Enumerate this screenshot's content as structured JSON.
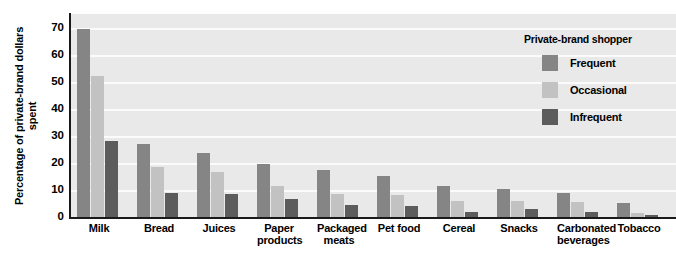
{
  "chart_data": {
    "type": "bar",
    "title": "",
    "xlabel": "",
    "ylabel": "Percentage of private-brand dollars spent",
    "ylim": [
      0,
      75
    ],
    "yticks": [
      0,
      10,
      20,
      30,
      40,
      50,
      60,
      70
    ],
    "grid": true,
    "legend_position": "top-right",
    "legend_title": "Private-brand shopper",
    "categories": [
      "Milk",
      "Bread",
      "Juices",
      "Paper products",
      "Packaged meats",
      "Pet food",
      "Cereal",
      "Snacks",
      "Carbonated beverages",
      "Tobacco"
    ],
    "series": [
      {
        "name": "Frequent",
        "color": "#858585",
        "values": [
          69.5,
          27,
          23.5,
          19.5,
          17.5,
          15,
          11.5,
          10.5,
          9,
          5
        ]
      },
      {
        "name": "Occasional",
        "color": "#c2c2c2",
        "values": [
          52,
          18.5,
          16.5,
          11.5,
          8.5,
          8,
          6,
          6,
          5.5,
          1.5
        ]
      },
      {
        "name": "Infrequent",
        "color": "#5c5c5c",
        "values": [
          28,
          9,
          8.5,
          6.5,
          4.5,
          4,
          2,
          3,
          2,
          0.7
        ]
      }
    ]
  },
  "axis": {
    "ytick_labels": [
      "70",
      "60",
      "50",
      "40",
      "30",
      "20",
      "10",
      "0"
    ]
  },
  "legend": {
    "title": "Private-brand shopper",
    "items": [
      {
        "label": "Frequent"
      },
      {
        "label": "Occasional"
      },
      {
        "label": "Infrequent"
      }
    ]
  }
}
